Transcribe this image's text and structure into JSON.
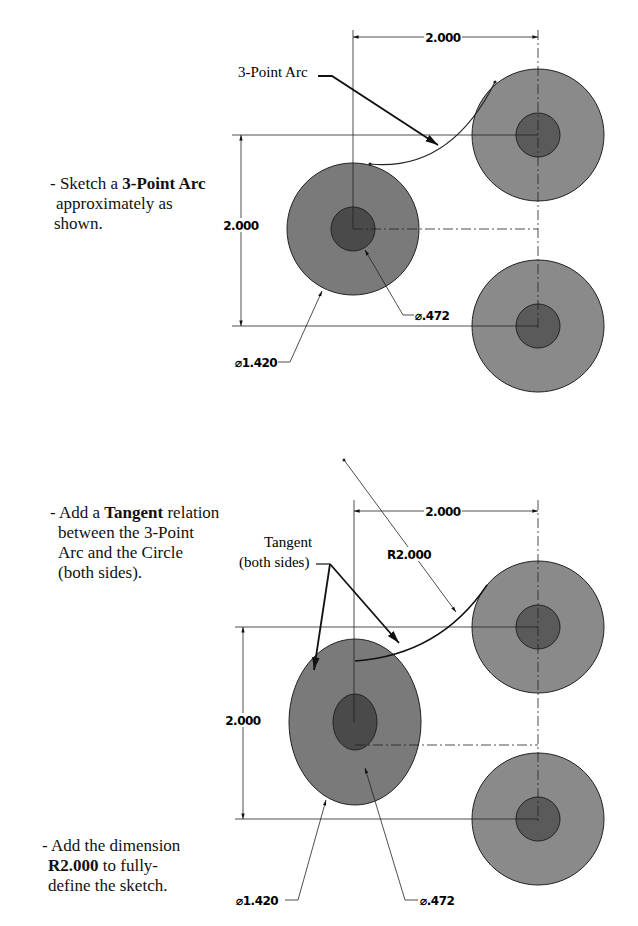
{
  "colors": {
    "outer_circle": "#8a8a8a",
    "inner_circle": "#555555",
    "line": "#111111"
  },
  "step1": {
    "instruction": {
      "prefix": "- Sketch a ",
      "bold": "3-Point Arc",
      "line2": "approximately as",
      "line3": "shown."
    },
    "callout_arc": "3-Point Arc",
    "dim_horizontal": "2.000",
    "dim_vertical": "2.000",
    "dim_inner_dia": "⌀.472",
    "dim_outer_dia": "⌀1.420"
  },
  "step2": {
    "instruction": {
      "prefix": "- Add a ",
      "bold": "Tangent",
      "suffix": " relation",
      "line2": "between the 3-Point",
      "line3": "Arc and the Circle",
      "line4": "(both sides)."
    },
    "callout_tangent_line1": "Tangent",
    "callout_tangent_line2": "(both sides)",
    "dim_radius": "R2.000",
    "dim_horizontal": "2.000",
    "dim_vertical": "2.000",
    "dim_inner_dia": "⌀.472",
    "dim_outer_dia": "⌀1.420"
  },
  "step3": {
    "instruction": {
      "prefix": "- Add the dimension",
      "bold": "R2.000",
      "suffix": " to fully-",
      "line3": "define the sketch."
    }
  }
}
